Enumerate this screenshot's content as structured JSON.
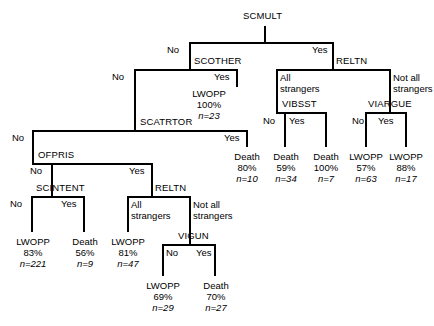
{
  "figure": {
    "type": "decision-tree",
    "root": "SCMULT",
    "width": 434,
    "height": 326,
    "line_color": "#000000",
    "text_color": "#000000"
  },
  "branch_labels": {
    "no": "No",
    "yes": "Yes",
    "all_strangers": "All strangers",
    "all_strangers_l1": "All",
    "all_strangers_l2": "strangers",
    "not_all_strangers": "Not all strangers",
    "not_all_strangers_l1": "Not all",
    "not_all_strangers_l2": "strangers"
  },
  "nodes": [
    {
      "id": "scmult",
      "label": "SCMULT",
      "x": 265,
      "y": 18
    },
    {
      "id": "scother",
      "label": "SCOTHER",
      "x": 196,
      "y": 61
    },
    {
      "id": "relt_top",
      "label": "RELTN",
      "x": 339,
      "y": 61
    },
    {
      "id": "vibsst",
      "label": "VIBSST",
      "x": 296,
      "y": 104
    },
    {
      "id": "viargue",
      "label": "VIARGUE",
      "x": 382,
      "y": 104
    },
    {
      "id": "scatrtor",
      "label": "SCATRTOR",
      "x": 196,
      "y": 122
    },
    {
      "id": "ofpris",
      "label": "OFPRIS",
      "x": 84,
      "y": 155
    },
    {
      "id": "scintent",
      "label": "SCINTENT",
      "x": 58,
      "y": 188
    },
    {
      "id": "relt_bot",
      "label": "RELTN",
      "x": 152,
      "y": 188
    },
    {
      "id": "vigun",
      "label": "VIGUN",
      "x": 178,
      "y": 236
    }
  ],
  "leaves": [
    {
      "id": "lwopp-23",
      "outcome": "LWOPP",
      "pct": "100%",
      "n": "n=23",
      "x": 209,
      "y": 92
    },
    {
      "id": "death-10",
      "outcome": "Death",
      "pct": "80%",
      "n": "n=10",
      "x": 247,
      "y": 155
    },
    {
      "id": "death-34",
      "outcome": "Death",
      "pct": "59%",
      "n": "n=34",
      "x": 285,
      "y": 155
    },
    {
      "id": "death-7",
      "outcome": "Death",
      "pct": "100%",
      "n": "n=7",
      "x": 326,
      "y": 155
    },
    {
      "id": "lwopp-63",
      "outcome": "LWOPP",
      "pct": "57%",
      "n": "n=63",
      "x": 366,
      "y": 155
    },
    {
      "id": "lwopp-17",
      "outcome": "LWOPP",
      "pct": "88%",
      "n": "n=17",
      "x": 406,
      "y": 155
    },
    {
      "id": "lwopp-221",
      "outcome": "LWOPP",
      "pct": "83%",
      "n": "n=221",
      "x": 32,
      "y": 240
    },
    {
      "id": "death-9",
      "outcome": "Death",
      "pct": "56%",
      "n": "n=9",
      "x": 84,
      "y": 240
    },
    {
      "id": "lwopp-47",
      "outcome": "LWOPP",
      "pct": "81%",
      "n": "n=47",
      "x": 128,
      "y": 240
    },
    {
      "id": "lwopp-29",
      "outcome": "LWOPP",
      "pct": "69%",
      "n": "n=29",
      "x": 163,
      "y": 284
    },
    {
      "id": "death-27",
      "outcome": "Death",
      "pct": "70%",
      "n": "n=27",
      "x": 215,
      "y": 284
    }
  ],
  "splits": [
    {
      "parent": "scmult",
      "left_label": "No",
      "right_label": "Yes",
      "left_child": "scother",
      "right_child": "relt_top"
    },
    {
      "parent": "scother",
      "left_label": "No",
      "right_label": "Yes",
      "left_child": "scatrtor",
      "right_child": "lwopp-23"
    },
    {
      "parent": "relt_top",
      "left_label": "All strangers",
      "right_label": "Not all strangers",
      "left_child": "vibsst",
      "right_child": "viargue"
    },
    {
      "parent": "vibsst",
      "left_label": "No",
      "right_label": "Yes",
      "left_child": "death-34",
      "right_child": "death-7"
    },
    {
      "parent": "viargue",
      "left_label": "No",
      "right_label": "Yes",
      "left_child": "lwopp-63",
      "right_child": "lwopp-17"
    },
    {
      "parent": "scatrtor",
      "left_label": "No",
      "right_label": "Yes",
      "left_child": "ofpris",
      "right_child": "death-10"
    },
    {
      "parent": "ofpris",
      "left_label": "No",
      "right_label": "Yes",
      "left_child": "scintent",
      "right_child": "relt_bot"
    },
    {
      "parent": "scintent",
      "left_label": "No",
      "right_label": "Yes",
      "left_child": "lwopp-221",
      "right_child": "death-9"
    },
    {
      "parent": "relt_bot",
      "left_label": "All strangers",
      "right_label": "Not all strangers",
      "left_child": "lwopp-47",
      "right_child": "vigun"
    },
    {
      "parent": "vigun",
      "left_label": "No",
      "right_label": "Yes",
      "left_child": "lwopp-29",
      "right_child": "death-27"
    }
  ]
}
